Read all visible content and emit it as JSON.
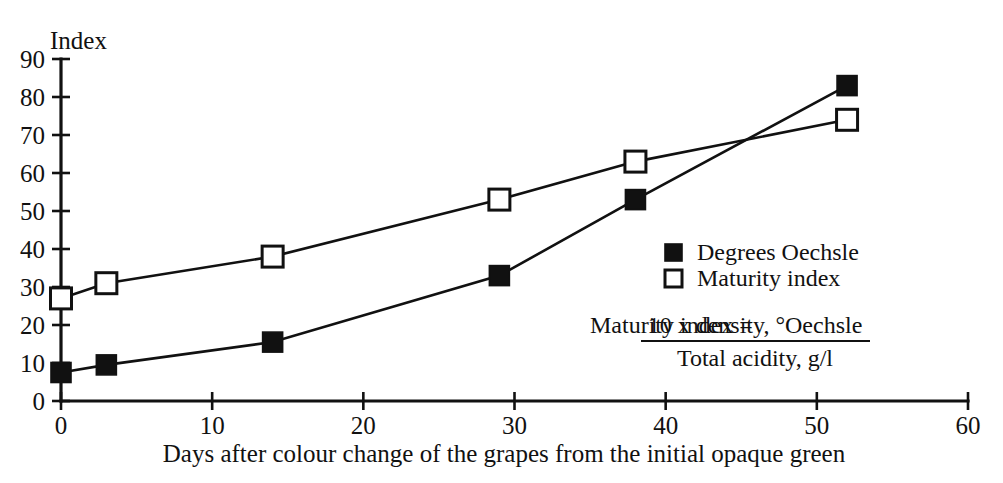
{
  "chart_data": {
    "type": "line",
    "title": "",
    "xlabel": "Days after colour change of the grapes from the initial opaque green",
    "ylabel": "Index",
    "xlim": [
      0,
      60
    ],
    "ylim": [
      0,
      90
    ],
    "xticks": [
      "0",
      "10",
      "20",
      "30",
      "40",
      "50",
      "60"
    ],
    "xtick_values": [
      0,
      10,
      20,
      30,
      40,
      50,
      60
    ],
    "yticks": [
      "0",
      "10",
      "20",
      "30",
      "40",
      "50",
      "60",
      "70",
      "80",
      "90"
    ],
    "ytick_values": [
      0,
      10,
      20,
      30,
      40,
      50,
      60,
      70,
      80,
      90
    ],
    "grid": false,
    "legend_position": "center-right",
    "x": [
      0,
      3,
      14,
      29,
      38,
      52
    ],
    "series": [
      {
        "name": "Degrees Oechsle",
        "marker": "filled-square",
        "color": "#111111",
        "values": [
          7.5,
          9.5,
          15.5,
          33,
          53,
          83
        ]
      },
      {
        "name": "Maturity index",
        "marker": "open-square",
        "color": "#111111",
        "values": [
          27,
          31,
          38,
          53,
          63,
          74
        ]
      }
    ],
    "annotations": [
      {
        "name": "maturity-index-formula",
        "lead": "Maturity index =",
        "numerator": "10 x density, °Oechsle",
        "denominator": "Total acidity, g/l"
      }
    ]
  },
  "legend": {
    "items": [
      {
        "label": "Degrees Oechsle",
        "marker": "filled-square"
      },
      {
        "label": "Maturity index",
        "marker": "open-square"
      }
    ]
  },
  "axes": {
    "y_title": "Index",
    "x_title": "Days after colour change of the grapes from the initial opaque green"
  },
  "formula": {
    "lead": "Maturity index =",
    "numerator": "10 x density, °Oechsle",
    "denominator": "Total acidity, g/l"
  },
  "colors": {
    "ink": "#111111",
    "background": "#ffffff"
  }
}
